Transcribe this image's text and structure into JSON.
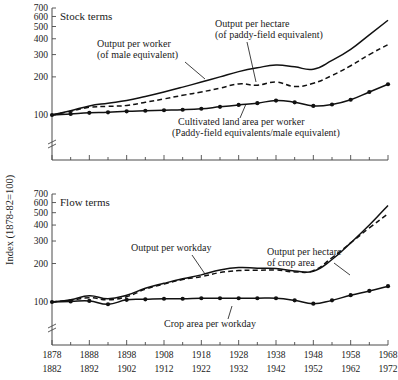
{
  "figure": {
    "y_axis_title": "Index (1878-82=100)",
    "background": "#ffffff",
    "ink": "#111111"
  },
  "chart_data": [
    {
      "type": "line",
      "title": "Stock terms",
      "panel": "top",
      "ylabel": "Index (1878-82=100)",
      "xlabel": "",
      "yscale": "log",
      "ylim": [
        90,
        760
      ],
      "yticks": [
        100,
        200,
        300,
        400,
        500,
        600,
        700
      ],
      "ytick_labels": [
        "100",
        "200",
        "300",
        "400",
        "500",
        "600",
        "700"
      ],
      "axis_break": true,
      "grid": false,
      "legend": "annotations",
      "x": [
        1878,
        1883,
        1888,
        1893,
        1898,
        1903,
        1908,
        1913,
        1918,
        1923,
        1928,
        1933,
        1938,
        1943,
        1948,
        1953,
        1958,
        1963,
        1968
      ],
      "xtick_labels_upper": [
        "1878",
        "1888",
        "1898",
        "1908",
        "1918",
        "1928",
        "1938",
        "1948",
        "1958",
        "1968"
      ],
      "xtick_labels_lower": [
        "1882",
        "1892",
        "1902",
        "1912",
        "1922",
        "1932",
        "1942",
        "1952",
        "1962",
        "1972"
      ],
      "series": [
        {
          "name": "Output per worker (of male equivalent)",
          "style": "solid",
          "markers": false,
          "values": [
            100,
            108,
            118,
            124,
            130,
            140,
            152,
            166,
            182,
            200,
            220,
            236,
            248,
            240,
            230,
            270,
            330,
            430,
            560
          ]
        },
        {
          "name": "Output per hectare (of paddy-field equivalent)",
          "style": "dashed",
          "markers": false,
          "values": [
            100,
            107,
            115,
            117,
            119,
            126,
            134,
            143,
            152,
            163,
            176,
            172,
            182,
            168,
            178,
            205,
            245,
            300,
            360
          ]
        },
        {
          "name": "Cultivated land area per worker (Paddy-field equivalents/male equivalent)",
          "style": "solid-marker",
          "markers": true,
          "values": [
            100,
            102,
            104,
            105,
            107,
            108,
            109,
            110,
            112,
            116,
            120,
            124,
            130,
            126,
            118,
            121,
            132,
            152,
            175
          ]
        }
      ],
      "annotations": [
        {
          "text": "Stock terms",
          "role": "panel-title"
        },
        {
          "text": "Output per worker",
          "role": "series-label"
        },
        {
          "text": "(of male equivalent)",
          "role": "series-label"
        },
        {
          "text": "Output per hectare",
          "role": "series-label"
        },
        {
          "text": "(of paddy-field equivalent)",
          "role": "series-label"
        },
        {
          "text": "Cultivated land area per worker",
          "role": "series-label"
        },
        {
          "text": "(Paddy-field equivalents/male equivalent)",
          "role": "series-label"
        }
      ]
    },
    {
      "type": "line",
      "title": "Flow terms",
      "panel": "bottom",
      "ylabel": "Index (1878-82=100)",
      "xlabel": "",
      "yscale": "log",
      "ylim": [
        90,
        760
      ],
      "yticks": [
        100,
        200,
        300,
        400,
        500,
        600,
        700
      ],
      "ytick_labels": [
        "100",
        "200",
        "300",
        "400",
        "500",
        "600",
        "700"
      ],
      "axis_break": true,
      "grid": false,
      "legend": "annotations",
      "x": [
        1878,
        1883,
        1888,
        1893,
        1898,
        1903,
        1908,
        1913,
        1918,
        1923,
        1928,
        1933,
        1938,
        1943,
        1948,
        1953,
        1958,
        1963,
        1968
      ],
      "xtick_labels_upper": [
        "1878",
        "1888",
        "1898",
        "1908",
        "1918",
        "1928",
        "1938",
        "1948",
        "1958",
        "1968"
      ],
      "xtick_labels_lower": [
        "1882",
        "1892",
        "1902",
        "1912",
        "1922",
        "1932",
        "1942",
        "1952",
        "1962",
        "1972"
      ],
      "series": [
        {
          "name": "Output per workday",
          "style": "solid",
          "markers": false,
          "values": [
            100,
            104,
            112,
            106,
            113,
            128,
            140,
            152,
            163,
            178,
            186,
            184,
            183,
            175,
            174,
            215,
            290,
            400,
            570
          ]
        },
        {
          "name": "Output per hectare of crop area",
          "style": "dashed",
          "markers": false,
          "values": [
            100,
            103,
            108,
            104,
            110,
            126,
            138,
            150,
            158,
            170,
            176,
            177,
            178,
            172,
            176,
            222,
            290,
            380,
            490
          ]
        },
        {
          "name": "Crop area per workday",
          "style": "solid-marker",
          "markers": true,
          "values": [
            100,
            101,
            102,
            96,
            104,
            105,
            106,
            106,
            107,
            107,
            107,
            107,
            107,
            103,
            97,
            103,
            113,
            122,
            133
          ]
        }
      ],
      "annotations": [
        {
          "text": "Flow terms",
          "role": "panel-title"
        },
        {
          "text": "Output per workday",
          "role": "series-label"
        },
        {
          "text": "Output per hectare",
          "role": "series-label"
        },
        {
          "text": "of crop area",
          "role": "series-label"
        },
        {
          "text": "Crop area per workday",
          "role": "series-label"
        }
      ]
    }
  ],
  "labels": {
    "top": {
      "panel_title": "Stock terms",
      "opw_line1": "Output per worker",
      "opw_line2": "(of male equivalent)",
      "oph_line1": "Output per hectare",
      "oph_line2": "(of paddy-field equivalent)",
      "cla_line1": "Cultivated land area per worker",
      "cla_line2": "(Paddy-field equivalents/male equivalent)"
    },
    "bottom": {
      "panel_title": "Flow terms",
      "opwd": "Output per workday",
      "ophc_line1": "Output per hectare",
      "ophc_line2": "of crop area",
      "capw": "Crop area per workday"
    }
  },
  "yticks": {
    "t700": "700",
    "t600": "600",
    "t500": "500",
    "t400": "400",
    "t300": "300",
    "t200": "200",
    "t100": "100"
  },
  "xticks_upper": {
    "x0": "1878",
    "x1": "1888",
    "x2": "1898",
    "x3": "1908",
    "x4": "1918",
    "x5": "1928",
    "x6": "1938",
    "x7": "1948",
    "x8": "1958",
    "x9": "1968"
  },
  "xticks_lower": {
    "x0": "1882",
    "x1": "1892",
    "x2": "1902",
    "x3": "1912",
    "x4": "1922",
    "x5": "1932",
    "x6": "1942",
    "x7": "1952",
    "x8": "1962",
    "x9": "1972"
  }
}
